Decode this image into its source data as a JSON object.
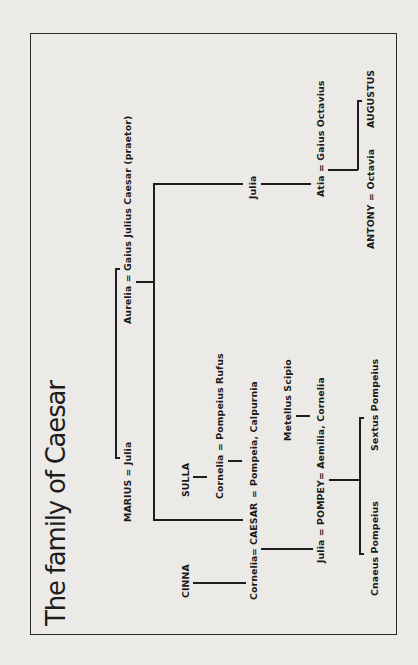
{
  "title": "The family of Caesar",
  "people": {
    "marius_julia": "MARIUS = Julia",
    "aurelia_gaius": "Aurelia = Gaius Julius Caesar (praetor)",
    "julia_sister": "Julia",
    "atia_octavius": "Atia = Gaius Octavius",
    "augustus": "AUGUSTUS",
    "antony_octavia": "ANTONY = Octavia",
    "sulla": "SULLA",
    "cornelia_rufus": "Cornelia = Pompeius Rufus",
    "cinna": "CINNA",
    "cornelia": "Cornelia",
    "eq1": "=",
    "caesar": "CAESAR",
    "eq2": "=",
    "caesar_wives": "Pompeia, Calpurnia",
    "metellus": "Metellus Scipio",
    "pompey": "Julia = POMPEY= Aemilia, Cornelia",
    "cnaeus": "Cnaeus Pompeius",
    "sextus": "Sextus Pompeius"
  },
  "colors": {
    "background": "#eceae6",
    "ink": "#1e1e1e"
  }
}
